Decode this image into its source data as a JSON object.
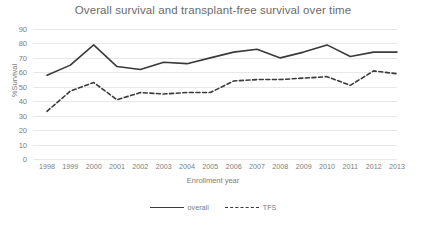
{
  "chart_data": {
    "type": "line",
    "title": "Overall survival and transplant-free survival over time",
    "xlabel": "Enrollment year",
    "ylabel": "%Survival",
    "categories": [
      "1998",
      "1999",
      "2000",
      "2001",
      "2002",
      "2003",
      "2004",
      "2005",
      "2006",
      "2007",
      "2008",
      "2009",
      "2010",
      "2011",
      "2012",
      "2013"
    ],
    "x": [
      1998,
      1999,
      2000,
      2001,
      2002,
      2003,
      2004,
      2005,
      2006,
      2007,
      2008,
      2009,
      2010,
      2011,
      2012,
      2013
    ],
    "ylim": [
      0,
      90
    ],
    "yticks": [
      0,
      10,
      20,
      30,
      40,
      50,
      60,
      70,
      80,
      90
    ],
    "grid": true,
    "legend_position": "bottom",
    "series": [
      {
        "name": "overall",
        "style": "solid",
        "color": "#3a3a3a",
        "values": [
          58,
          65,
          79,
          64,
          62,
          67,
          66,
          70,
          74,
          76,
          70,
          74,
          79,
          71,
          74,
          74
        ]
      },
      {
        "name": "TFS",
        "style": "dashed",
        "color": "#3a3a3a",
        "values": [
          33,
          47,
          53,
          41,
          46,
          45,
          46,
          46,
          54,
          55,
          55,
          56,
          57,
          51,
          61,
          59
        ]
      }
    ]
  }
}
